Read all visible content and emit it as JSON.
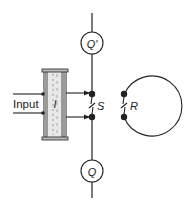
{
  "diagram": {
    "colors": {
      "stroke": "#222222",
      "background": "#ffffff",
      "cylinder_fill": "#e8e8e8",
      "cylinder_shade": "#9a9a9a"
    },
    "labels": {
      "input": "Input",
      "cylinder": "I",
      "switch_s": "S",
      "switch_r": "R",
      "meter_top": "Q'",
      "meter_bottom": "Q"
    },
    "nodes": [
      {
        "id": "s-upper",
        "x": 92,
        "y": 95
      },
      {
        "id": "s-lower",
        "x": 92,
        "y": 117
      },
      {
        "id": "r-upper",
        "x": 124,
        "y": 95
      },
      {
        "id": "r-lower",
        "x": 124,
        "y": 117
      }
    ]
  }
}
